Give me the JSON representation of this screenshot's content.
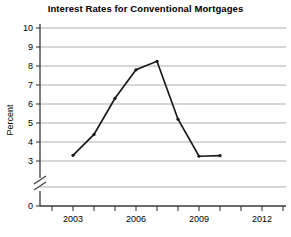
{
  "chart_data": {
    "type": "line",
    "title": "Interest Rates for Conventional Mortgages",
    "xlabel": "",
    "ylabel": "Percent",
    "x": [
      2003,
      2004,
      2005,
      2006,
      2007,
      2008,
      2009,
      2010
    ],
    "values": [
      3.3,
      4.4,
      6.3,
      7.8,
      8.25,
      5.2,
      3.25,
      3.28
    ],
    "series": [
      {
        "name": "Interest Rate",
        "values": [
          3.3,
          4.4,
          6.3,
          7.8,
          8.25,
          5.2,
          3.25,
          3.28
        ]
      }
    ],
    "xlim": [
      2002,
      2013
    ],
    "ylim": [
      3,
      10
    ],
    "y_axis_break": true,
    "y_axis_break_between": [
      0,
      3
    ],
    "y_ticks": [
      0,
      3,
      4,
      5,
      6,
      7,
      8,
      9,
      10
    ],
    "y_tick_labels": [
      "0",
      "3",
      "4",
      "5",
      "6",
      "7",
      "8",
      "9",
      "10"
    ],
    "x_ticks": [
      2002,
      2003,
      2004,
      2005,
      2006,
      2007,
      2008,
      2009,
      2010,
      2011,
      2012,
      2013
    ],
    "x_tick_labels": [
      "",
      "2003",
      "",
      "",
      "2006",
      "",
      "",
      "2009",
      "",
      "",
      "2012",
      ""
    ],
    "x_labeled_ticks": [
      {
        "value": 2003,
        "label": "2003"
      },
      {
        "value": 2006,
        "label": "2006"
      },
      {
        "value": 2009,
        "label": "2009"
      },
      {
        "value": 2012,
        "label": "2012"
      }
    ],
    "grid": true,
    "grid_axis": "y",
    "legend": false,
    "legend_position": "none",
    "markers": true,
    "line_color": "#1a1a1a",
    "grid_color": "#9a9a9a",
    "background_color": "#ffffff"
  }
}
